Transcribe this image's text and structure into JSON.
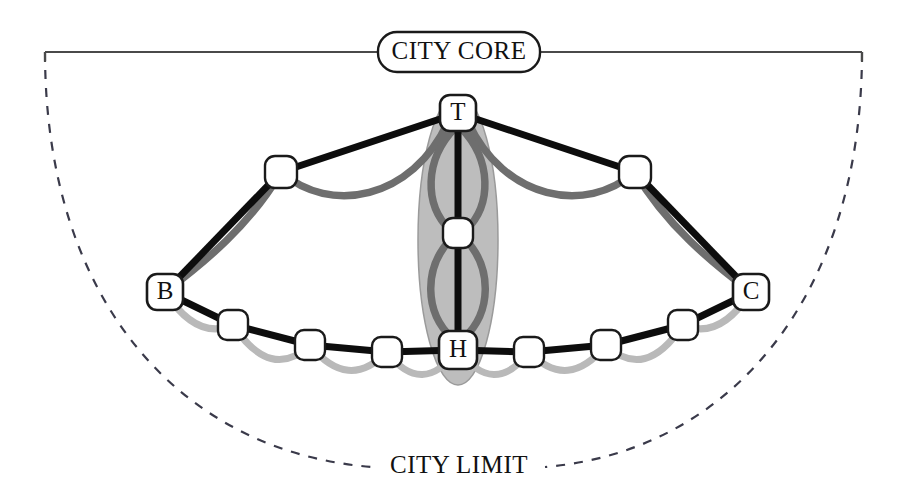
{
  "figure": {
    "type": "network-topology-diagram",
    "background_color": "#ffffff",
    "width": 905,
    "height": 503
  },
  "frame": {
    "top_label": "CITY CORE",
    "bottom_label": "CITY LIMIT",
    "top_bar_color": "#4a4a4a",
    "dashed_arc_color": "#3a3a4a",
    "dashed_pattern": "9 9"
  },
  "colors": {
    "node_fill": "#ffffff",
    "node_stroke": "#1a1a1a",
    "primary_link": "#0d0d0d",
    "secondary_link": "#6e6e6e",
    "tertiary_link": "#b9b9b9",
    "cluster_fill": "#bdbdbd",
    "cluster_stroke": "#8a8a8a",
    "label_text": "#111111"
  },
  "cluster": {
    "name": "core-cluster-ellipse",
    "center_x": 458,
    "center_y": 240,
    "rx": 40,
    "ry": 145,
    "fill": "#bdbdbd",
    "opacity": 0.95
  },
  "nodes": [
    {
      "id": "T",
      "label": "T",
      "x": 458,
      "y": 113,
      "size": 36,
      "labeled": true
    },
    {
      "id": "M",
      "label": "",
      "x": 458,
      "y": 233,
      "size": 30,
      "labeled": false
    },
    {
      "id": "H",
      "label": "H",
      "x": 458,
      "y": 350,
      "size": 38,
      "labeled": true
    },
    {
      "id": "B",
      "label": "B",
      "x": 165,
      "y": 292,
      "size": 36,
      "labeled": true
    },
    {
      "id": "C",
      "label": "C",
      "x": 751,
      "y": 292,
      "size": 36,
      "labeled": true
    },
    {
      "id": "UL",
      "label": "",
      "x": 281,
      "y": 172,
      "size": 32,
      "labeled": false
    },
    {
      "id": "UR",
      "label": "",
      "x": 635,
      "y": 172,
      "size": 32,
      "labeled": false
    },
    {
      "id": "L1",
      "label": "",
      "x": 233,
      "y": 325,
      "size": 30,
      "labeled": false
    },
    {
      "id": "L2",
      "label": "",
      "x": 310,
      "y": 345,
      "size": 30,
      "labeled": false
    },
    {
      "id": "L3",
      "label": "",
      "x": 387,
      "y": 352,
      "size": 30,
      "labeled": false
    },
    {
      "id": "R3",
      "label": "",
      "x": 529,
      "y": 352,
      "size": 30,
      "labeled": false
    },
    {
      "id": "R2",
      "label": "",
      "x": 606,
      "y": 345,
      "size": 30,
      "labeled": false
    },
    {
      "id": "R1",
      "label": "",
      "x": 683,
      "y": 325,
      "size": 30,
      "labeled": false
    }
  ],
  "links": {
    "primary_straight": [
      {
        "from": "UL",
        "to": "T",
        "style": "solid-black"
      },
      {
        "from": "UR",
        "to": "T",
        "style": "solid-black"
      },
      {
        "from": "B",
        "to": "UL",
        "style": "solid-black"
      },
      {
        "from": "C",
        "to": "UR",
        "style": "solid-black"
      },
      {
        "from": "T",
        "to": "M",
        "style": "solid-black"
      },
      {
        "from": "M",
        "to": "H",
        "style": "solid-black"
      },
      {
        "from": "B",
        "to": "L1",
        "style": "solid-black"
      },
      {
        "from": "L1",
        "to": "L2",
        "style": "solid-black"
      },
      {
        "from": "L2",
        "to": "L3",
        "style": "solid-black"
      },
      {
        "from": "L3",
        "to": "H",
        "style": "solid-black"
      },
      {
        "from": "H",
        "to": "R3",
        "style": "solid-black"
      },
      {
        "from": "R3",
        "to": "R2",
        "style": "solid-black"
      },
      {
        "from": "R2",
        "to": "R1",
        "style": "solid-black"
      },
      {
        "from": "R1",
        "to": "C",
        "style": "solid-black"
      }
    ],
    "secondary_curved": [
      {
        "from": "UL",
        "to": "T",
        "style": "gray-arc"
      },
      {
        "from": "UR",
        "to": "T",
        "style": "gray-arc"
      },
      {
        "from": "B",
        "to": "UL",
        "style": "gray-arc"
      },
      {
        "from": "C",
        "to": "UR",
        "style": "gray-arc"
      },
      {
        "from": "T",
        "to": "M",
        "style": "gray-arc-pair"
      },
      {
        "from": "M",
        "to": "H",
        "style": "gray-arc-pair"
      }
    ],
    "tertiary_curved": [
      {
        "from": "B",
        "to": "L1",
        "style": "light-gray-sag"
      },
      {
        "from": "L1",
        "to": "L2",
        "style": "light-gray-sag"
      },
      {
        "from": "L2",
        "to": "L3",
        "style": "light-gray-sag"
      },
      {
        "from": "L3",
        "to": "H",
        "style": "light-gray-sag"
      },
      {
        "from": "H",
        "to": "R3",
        "style": "light-gray-sag"
      },
      {
        "from": "R3",
        "to": "R2",
        "style": "light-gray-sag"
      },
      {
        "from": "R2",
        "to": "R1",
        "style": "light-gray-sag"
      },
      {
        "from": "R1",
        "to": "C",
        "style": "light-gray-sag"
      }
    ]
  }
}
